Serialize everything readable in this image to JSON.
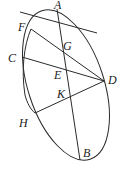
{
  "diagram": {
    "type": "geometry",
    "colors": {
      "stroke": "#2a2a2a",
      "background": "#ffffff"
    },
    "points": {
      "A": {
        "label": "A",
        "x": 57,
        "y": 9
      },
      "B": {
        "label": "B",
        "x": 80,
        "y": 160
      },
      "C": {
        "label": "C",
        "x": 22,
        "y": 57
      },
      "D": {
        "label": "D",
        "x": 104,
        "y": 81
      },
      "E": {
        "label": "E",
        "x": 65,
        "y": 68
      },
      "F": {
        "label": "F",
        "x": 31,
        "y": 29
      },
      "G": {
        "label": "G",
        "x": 61,
        "y": 47
      },
      "H": {
        "label": "H",
        "x": 35,
        "y": 113
      },
      "K": {
        "label": "K",
        "x": 69,
        "y": 96
      }
    },
    "segments": [
      [
        "tangent-start",
        "tangent-end"
      ],
      [
        "A",
        "B"
      ],
      [
        "F",
        "D"
      ],
      [
        "C",
        "D"
      ],
      [
        "H",
        "D"
      ]
    ]
  }
}
